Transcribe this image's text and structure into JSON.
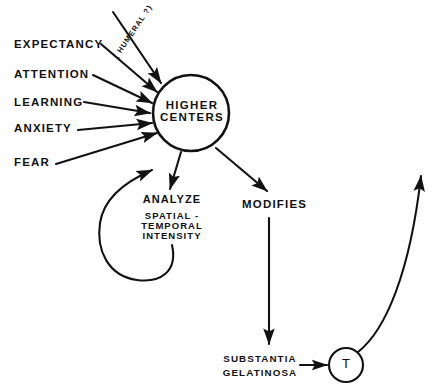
{
  "diagram": {
    "background_color": "#fefefe",
    "ink_color": "#121212",
    "inputs": [
      {
        "label": "EXPECTANCY"
      },
      {
        "label": "ATTENTION"
      },
      {
        "label": "LEARNING"
      },
      {
        "label": "ANXIETY"
      },
      {
        "label": "FEAR"
      }
    ],
    "humoral_label": "( HUMERAL ?)",
    "center_node": {
      "line1": "HIGHER",
      "line2": "CENTERS"
    },
    "analyze_block": {
      "heading": "ANALYZE",
      "line1": "SPATIAL -",
      "line2": "TEMPORAL",
      "line3": "INTENSITY"
    },
    "modifies_label": "MODIFIES",
    "substantia_block": {
      "line1": "SUBSTANTIA",
      "line2": "GELATINOSA"
    },
    "t_node": {
      "label": "T"
    }
  }
}
